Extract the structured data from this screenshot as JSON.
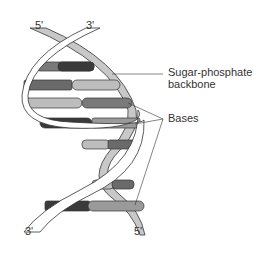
{
  "diagram": {
    "labels": {
      "top_left_end": "5'",
      "top_right_end": "3'",
      "bottom_left_end": "3'",
      "bottom_right_end": "5'",
      "backbone_line1": "Sugar-phosphate",
      "backbone_line2": "backbone",
      "bases": "Bases"
    },
    "colors": {
      "outline": "#333333",
      "backbone_front": "#ffffff",
      "backbone_back": "#c8c8c8",
      "base_dark": "#3a3a3a",
      "base_mid": "#7a7a7a",
      "base_light": "#bdbdbd"
    }
  }
}
